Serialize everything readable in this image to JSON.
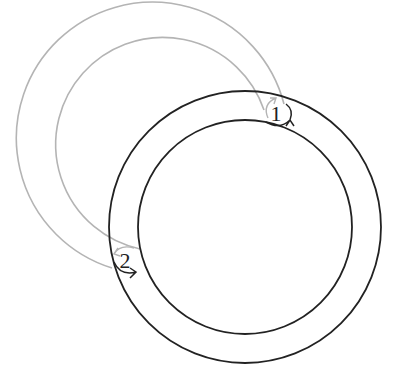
{
  "diagram": {
    "colors": {
      "current_ring": "#222222",
      "ghost_ring": "#b4b4b4",
      "background": "#ffffff"
    },
    "current_ring": {
      "cx": 245,
      "cy": 227,
      "r_outer": 136,
      "r_inner": 107
    },
    "ghost_ring": {
      "cx": 158,
      "cy": 143,
      "r_outer": 136,
      "r_inner": 107
    },
    "markers": [
      {
        "label": "1",
        "x": 276,
        "y": 121
      },
      {
        "label": "2",
        "x": 125,
        "y": 268
      }
    ]
  }
}
